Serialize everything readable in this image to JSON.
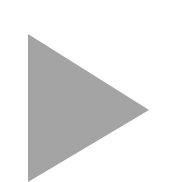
{
  "icon": {
    "name": "play-icon",
    "shape": "triangle-right",
    "fill_color": "#a4a4a4",
    "background_color": "#ffffff",
    "points": "28,34 149,110 28,182"
  }
}
